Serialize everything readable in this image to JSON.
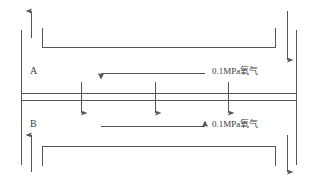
{
  "figure": {
    "type": "membrane-separation-schematic",
    "stroke_color": "#565656",
    "text_color": "#3a3a3a",
    "background": "#ffffff"
  },
  "labels": {
    "channel_a": "A",
    "channel_b": "B",
    "gas_a": "0.1MPa氧气",
    "gas_b": "0.1MPa氧气"
  },
  "flows": {
    "channel_a_direction": "left",
    "channel_b_direction": "right",
    "permeation_direction": "down",
    "permeation_arrow_count": 3,
    "inlet_outlet": [
      {
        "name": "top-left-outlet",
        "direction": "up"
      },
      {
        "name": "top-right-inlet",
        "direction": "down"
      },
      {
        "name": "bottom-left-inlet",
        "direction": "up"
      },
      {
        "name": "bottom-right-outlet",
        "direction": "down"
      }
    ]
  },
  "geometry": {
    "outer_wall_left_x": 21,
    "outer_wall_right_x": 297,
    "membrane_top_y": 93,
    "membrane_bottom_y": 100,
    "channel_a_top_y": 47,
    "channel_b_bottom_y": 146
  }
}
